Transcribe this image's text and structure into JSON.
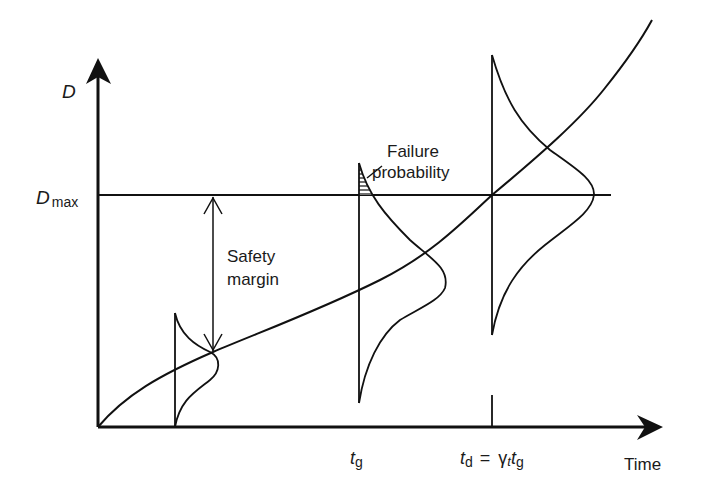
{
  "diagram": {
    "y_axis_label": "D",
    "dmax_label": {
      "main": "D",
      "sub": "max"
    },
    "x_axis_label": "Time",
    "safety_margin_label": [
      "Safety",
      "margin"
    ],
    "failure_probability_label": [
      "Failure",
      "probability"
    ],
    "tg_label": {
      "main": "t",
      "sub": "g"
    },
    "td_label": {
      "t": "t",
      "d": "d",
      "eq": "=",
      "gamma": "γ",
      "gsub": "t",
      "t2": "t",
      "g": "g"
    },
    "colors": {
      "line": "#111111",
      "background": "#ffffff"
    }
  }
}
